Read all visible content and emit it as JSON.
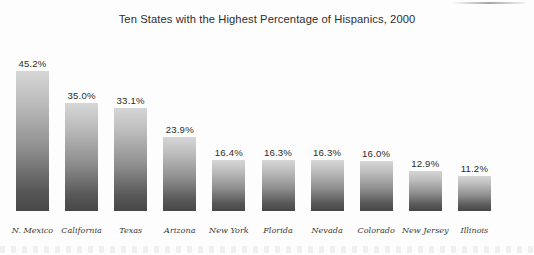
{
  "chart_data": {
    "type": "bar",
    "title": "Ten States with the Highest Percentage of Hispanics, 2000",
    "xlabel": "",
    "ylabel": "",
    "ylim": [
      0,
      50
    ],
    "grid": false,
    "legend": "none",
    "value_suffix": "%",
    "categories": [
      "N. Mexico",
      "California",
      "Texas",
      "Arizona",
      "New York",
      "Florida",
      "Nevada",
      "Colorado",
      "New Jersey",
      "Illinois"
    ],
    "values": [
      45.2,
      35.0,
      33.1,
      23.9,
      16.4,
      16.3,
      16.3,
      16.0,
      12.9,
      11.2
    ],
    "value_labels": [
      "45.2%",
      "35.0%",
      "33.1%",
      "23.9%",
      "16.4%",
      "16.3%",
      "16.3%",
      "16.0%",
      "12.9%",
      "11.2%"
    ],
    "colors": {
      "bar_top": "#d6d6d6",
      "bar_bottom": "#474747",
      "title_text": "#2e2e2e",
      "value_text": "#2b2b2b",
      "category_text": "#3a3a3a",
      "background": "#fdfdfd"
    }
  }
}
